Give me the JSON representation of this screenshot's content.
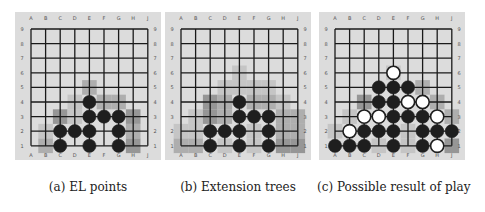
{
  "figure": {
    "columns": [
      "A",
      "B",
      "C",
      "D",
      "E",
      "F",
      "G",
      "H",
      "J"
    ],
    "rows": [
      "9",
      "8",
      "7",
      "6",
      "5",
      "4",
      "3",
      "2",
      "1"
    ],
    "colors": {
      "board_bg": "#dcdcdc",
      "grid_line": "#1a1a1a",
      "black_stone": "#1e1e1e",
      "white_stone": "#ffffff",
      "shade_light": "#c2c2c2",
      "shade_mid": "#a8a8a8",
      "shade_dark": "#8e8e8e"
    },
    "panels": [
      {
        "id": "a",
        "caption": "(a) EL points",
        "left": 15,
        "shading": [
          {
            "c": "E",
            "r": 5,
            "tone": "shade_mid"
          },
          {
            "c": "D",
            "r": 4,
            "tone": "shade_light"
          },
          {
            "c": "F",
            "r": 4,
            "tone": "shade_mid"
          },
          {
            "c": "G",
            "r": 4,
            "tone": "shade_mid"
          },
          {
            "c": "C",
            "r": 3,
            "tone": "shade_dark"
          },
          {
            "c": "D",
            "r": 3,
            "tone": "shade_light"
          },
          {
            "c": "H",
            "r": 3,
            "tone": "shade_dark"
          },
          {
            "c": "B",
            "r": 2,
            "tone": "shade_light"
          },
          {
            "c": "H",
            "r": 2,
            "tone": "shade_mid"
          },
          {
            "c": "B",
            "r": 1,
            "tone": "shade_mid"
          },
          {
            "c": "H",
            "r": 1,
            "tone": "shade_dark"
          }
        ],
        "stones": [
          {
            "c": "E",
            "r": 4,
            "color": "black"
          },
          {
            "c": "E",
            "r": 3,
            "color": "black"
          },
          {
            "c": "F",
            "r": 3,
            "color": "black"
          },
          {
            "c": "G",
            "r": 3,
            "color": "black"
          },
          {
            "c": "C",
            "r": 2,
            "color": "black"
          },
          {
            "c": "D",
            "r": 2,
            "color": "black"
          },
          {
            "c": "E",
            "r": 2,
            "color": "black"
          },
          {
            "c": "G",
            "r": 2,
            "color": "black"
          },
          {
            "c": "C",
            "r": 1,
            "color": "black"
          },
          {
            "c": "E",
            "r": 1,
            "color": "black"
          },
          {
            "c": "G",
            "r": 1,
            "color": "black"
          }
        ]
      },
      {
        "id": "b",
        "caption": "(b) Extension trees",
        "left": 165,
        "shading": [
          {
            "c": "E",
            "r": 6,
            "tone": "shade_light"
          },
          {
            "c": "E",
            "r": 5,
            "tone": "shade_light"
          },
          {
            "c": "D",
            "r": 5,
            "tone": "shade_light"
          },
          {
            "c": "F",
            "r": 5,
            "tone": "shade_light"
          },
          {
            "c": "G",
            "r": 5,
            "tone": "shade_light"
          },
          {
            "c": "C",
            "r": 4,
            "tone": "shade_dark"
          },
          {
            "c": "D",
            "r": 4,
            "tone": "shade_mid"
          },
          {
            "c": "F",
            "r": 4,
            "tone": "shade_mid"
          },
          {
            "c": "G",
            "r": 4,
            "tone": "shade_mid"
          },
          {
            "c": "H",
            "r": 4,
            "tone": "shade_light"
          },
          {
            "c": "B",
            "r": 3,
            "tone": "shade_light"
          },
          {
            "c": "C",
            "r": 3,
            "tone": "shade_dark"
          },
          {
            "c": "D",
            "r": 3,
            "tone": "shade_mid"
          },
          {
            "c": "H",
            "r": 3,
            "tone": "shade_mid"
          },
          {
            "c": "J",
            "r": 3,
            "tone": "shade_mid"
          },
          {
            "c": "A",
            "r": 2,
            "tone": "shade_light"
          },
          {
            "c": "B",
            "r": 2,
            "tone": "shade_light"
          },
          {
            "c": "F",
            "r": 2,
            "tone": "shade_light"
          },
          {
            "c": "H",
            "r": 2,
            "tone": "shade_mid"
          },
          {
            "c": "J",
            "r": 2,
            "tone": "shade_mid"
          },
          {
            "c": "A",
            "r": 1,
            "tone": "shade_mid"
          },
          {
            "c": "B",
            "r": 1,
            "tone": "shade_mid"
          },
          {
            "c": "D",
            "r": 1,
            "tone": "shade_light"
          },
          {
            "c": "F",
            "r": 1,
            "tone": "shade_light"
          },
          {
            "c": "H",
            "r": 1,
            "tone": "shade_dark"
          },
          {
            "c": "J",
            "r": 1,
            "tone": "shade_dark"
          }
        ],
        "stones": [
          {
            "c": "E",
            "r": 4,
            "color": "black"
          },
          {
            "c": "E",
            "r": 3,
            "color": "black"
          },
          {
            "c": "F",
            "r": 3,
            "color": "black"
          },
          {
            "c": "G",
            "r": 3,
            "color": "black"
          },
          {
            "c": "C",
            "r": 2,
            "color": "black"
          },
          {
            "c": "D",
            "r": 2,
            "color": "black"
          },
          {
            "c": "E",
            "r": 2,
            "color": "black"
          },
          {
            "c": "G",
            "r": 2,
            "color": "black"
          },
          {
            "c": "C",
            "r": 1,
            "color": "black"
          },
          {
            "c": "E",
            "r": 1,
            "color": "black"
          },
          {
            "c": "G",
            "r": 1,
            "color": "black"
          }
        ]
      },
      {
        "id": "c",
        "caption": "(c) Possible result of play",
        "left": 319,
        "shading": [
          {
            "c": "E",
            "r": 6,
            "tone": "shade_light"
          },
          {
            "c": "G",
            "r": 5,
            "tone": "shade_mid"
          },
          {
            "c": "C",
            "r": 4,
            "tone": "shade_dark"
          },
          {
            "c": "H",
            "r": 4,
            "tone": "shade_mid"
          },
          {
            "c": "B",
            "r": 3,
            "tone": "shade_light"
          },
          {
            "c": "J",
            "r": 3,
            "tone": "shade_mid"
          },
          {
            "c": "A",
            "r": 2,
            "tone": "shade_light"
          },
          {
            "c": "F",
            "r": 2,
            "tone": "shade_light"
          },
          {
            "c": "F",
            "r": 1,
            "tone": "shade_light"
          },
          {
            "c": "J",
            "r": 1,
            "tone": "shade_dark"
          },
          {
            "c": "D",
            "r": 1,
            "tone": "shade_light"
          }
        ],
        "stones": [
          {
            "c": "E",
            "r": 6,
            "color": "white"
          },
          {
            "c": "D",
            "r": 5,
            "color": "black"
          },
          {
            "c": "E",
            "r": 5,
            "color": "black"
          },
          {
            "c": "F",
            "r": 5,
            "color": "black"
          },
          {
            "c": "D",
            "r": 4,
            "color": "black"
          },
          {
            "c": "E",
            "r": 4,
            "color": "black"
          },
          {
            "c": "F",
            "r": 4,
            "color": "white"
          },
          {
            "c": "G",
            "r": 4,
            "color": "white"
          },
          {
            "c": "C",
            "r": 3,
            "color": "white"
          },
          {
            "c": "D",
            "r": 3,
            "color": "white"
          },
          {
            "c": "E",
            "r": 3,
            "color": "black"
          },
          {
            "c": "F",
            "r": 3,
            "color": "black"
          },
          {
            "c": "G",
            "r": 3,
            "color": "black"
          },
          {
            "c": "H",
            "r": 3,
            "color": "white"
          },
          {
            "c": "B",
            "r": 2,
            "color": "white"
          },
          {
            "c": "C",
            "r": 2,
            "color": "black"
          },
          {
            "c": "D",
            "r": 2,
            "color": "black"
          },
          {
            "c": "E",
            "r": 2,
            "color": "black"
          },
          {
            "c": "G",
            "r": 2,
            "color": "black"
          },
          {
            "c": "H",
            "r": 2,
            "color": "black"
          },
          {
            "c": "J",
            "r": 2,
            "color": "black"
          },
          {
            "c": "A",
            "r": 1,
            "color": "black"
          },
          {
            "c": "B",
            "r": 1,
            "color": "black"
          },
          {
            "c": "C",
            "r": 1,
            "color": "black"
          },
          {
            "c": "E",
            "r": 1,
            "color": "black"
          },
          {
            "c": "G",
            "r": 1,
            "color": "black"
          },
          {
            "c": "H",
            "r": 1,
            "color": "white"
          }
        ]
      }
    ]
  }
}
